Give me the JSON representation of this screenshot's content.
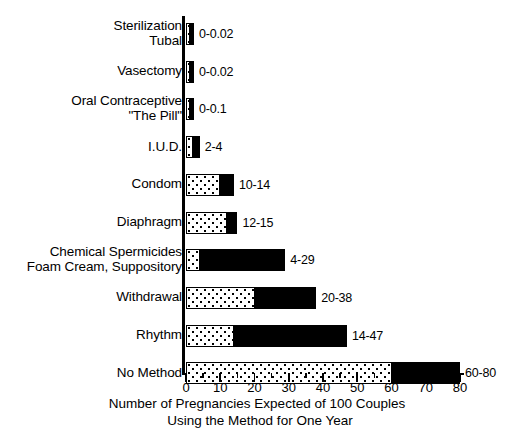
{
  "chart_data": {
    "type": "bar",
    "orientation": "horizontal",
    "title": "",
    "xlabel": "Number of Pregnancies Expected of 100 Couples Using the Method for One Year",
    "xlabel_lines": [
      "Number of Pregnancies Expected of 100 Couples",
      "Using the Method for One Year"
    ],
    "ylabel": "",
    "xlim": [
      0,
      80
    ],
    "xticks": [
      0,
      10,
      20,
      30,
      40,
      50,
      60,
      70,
      80
    ],
    "xtick_labels": [
      "0",
      "10",
      "20",
      "30",
      "40",
      "50",
      "60",
      "70",
      "80"
    ],
    "minor_tick_step": 5,
    "grid": false,
    "legend": "none",
    "value_label_format": "low-high",
    "categories": [
      "Sterilization Tubal",
      "Vasectomy",
      "Oral Contraceptive \"The Pill\"",
      "I.U.D.",
      "Condom",
      "Diaphragm",
      "Chemical Spermicides Foam Cream, Suppository",
      "Withdrawal",
      "Rhythm",
      "No Method"
    ],
    "series": [
      {
        "name": "Lowest expected rate",
        "values": [
          0,
          0,
          0,
          2,
          10,
          12,
          4,
          20,
          14,
          60
        ]
      },
      {
        "name": "Typical (highest) rate",
        "values": [
          0.02,
          0.02,
          0.1,
          4,
          14,
          15,
          29,
          38,
          47,
          80
        ]
      }
    ],
    "bars": [
      {
        "label_lines": [
          "Sterilization",
          "Tubal"
        ],
        "low": 0,
        "high": 0.02,
        "value_label": "0-0.02",
        "dot_px_min": 4
      },
      {
        "label_lines": [
          "Vasectomy"
        ],
        "low": 0,
        "high": 0.02,
        "value_label": "0-0.02",
        "dot_px_min": 4
      },
      {
        "label_lines": [
          "Oral Contraceptive",
          "\"The Pill\""
        ],
        "low": 0,
        "high": 0.1,
        "value_label": "0-0.1",
        "dot_px_min": 4
      },
      {
        "label_lines": [
          "I.U.D."
        ],
        "low": 2,
        "high": 4,
        "value_label": "2-4",
        "dot_px_min": 0
      },
      {
        "label_lines": [
          "Condom"
        ],
        "low": 10,
        "high": 14,
        "value_label": "10-14",
        "dot_px_min": 0
      },
      {
        "label_lines": [
          "Diaphragm"
        ],
        "low": 12,
        "high": 15,
        "value_label": "12-15",
        "dot_px_min": 0
      },
      {
        "label_lines": [
          "Chemical Spermicides",
          "Foam Cream, Suppository"
        ],
        "low": 4,
        "high": 29,
        "value_label": "4-29",
        "dot_px_min": 0
      },
      {
        "label_lines": [
          "Withdrawal"
        ],
        "low": 20,
        "high": 38,
        "value_label": "20-38",
        "dot_px_min": 0
      },
      {
        "label_lines": [
          "Rhythm"
        ],
        "low": 14,
        "high": 47,
        "value_label": "14-47",
        "dot_px_min": 0
      },
      {
        "label_lines": [
          "No Method"
        ],
        "low": 60,
        "high": 80,
        "value_label": "60-80",
        "dot_px_min": 0
      }
    ],
    "colors": {
      "low_segment_fill": "#ffffff",
      "low_segment_pattern": "#000000",
      "high_segment_fill": "#000000",
      "axis": "#000000",
      "text": "#000000",
      "background": "#ffffff"
    }
  }
}
